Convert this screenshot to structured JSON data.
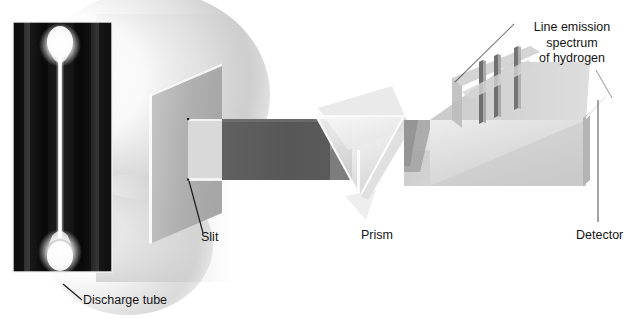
{
  "figure": {
    "type": "optical-spectroscopy-schematic"
  },
  "labels": {
    "spectrum": "Line emission\nspectrum\nof hydrogen",
    "spectrum_line1": "Line emission",
    "spectrum_line2": "spectrum",
    "spectrum_line3": "of hydrogen",
    "detector": "Detector",
    "prism": "Prism",
    "slit": "Slit",
    "discharge_tube": "Discharge tube"
  },
  "components": {
    "discharge_tube": {
      "name": "discharge-tube-photograph",
      "description": "photograph of glowing hydrogen discharge tube",
      "x": 13,
      "y": 22,
      "width": 99,
      "height": 250
    },
    "glow": {
      "name": "light-glow",
      "description": "soft white glow emitted from the discharge tube"
    },
    "slit_plate": {
      "name": "slit-plate",
      "description": "upright grey plate containing a narrow rectangular slit"
    },
    "beam": {
      "name": "collimated-beam",
      "description": "dark grey beam travelling from slit to prism"
    },
    "prism": {
      "name": "prism",
      "description": "translucent triangular glass prism that disperses light"
    },
    "dispersed_fan": {
      "name": "dispersed-light-fan",
      "description": "fan of dispersed light travelling from prism to detector"
    },
    "detector": {
      "name": "detector-panel",
      "description": "flat detector panel displaying the emission lines"
    },
    "emission_lines": {
      "name": "hydrogen-emission-lines",
      "count": 3,
      "description": "three discrete bright vertical spectral lines of hydrogen"
    }
  },
  "colors": {
    "background": "#ffffff",
    "text": "#141414",
    "plate_face": "#b2b2b2",
    "plate_edge": "#f7f7f7",
    "beam_dark": "#5c5c5c",
    "beam_mid": "#cfcfcf",
    "prism_glass": "#e9e9e9",
    "detector_face": "#d8d8d8",
    "line_dark": "#6b6b6b",
    "leader": "#1a1a1a"
  }
}
